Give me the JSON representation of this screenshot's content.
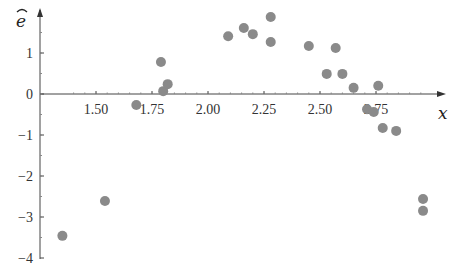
{
  "chart_data": {
    "type": "scatter",
    "title": "",
    "xlabel": "x",
    "ylabel": "ê (residuals)",
    "xlim": [
      1.33,
      3.05
    ],
    "ylim": [
      -4,
      2
    ],
    "x_ticks": [
      1.5,
      1.75,
      2.0,
      2.25,
      2.5,
      2.75
    ],
    "x_tick_labels": [
      "1.50",
      "1.75",
      "2.00",
      "2.25",
      "2.50",
      "2.75"
    ],
    "y_ticks": [
      -4,
      -3,
      -2,
      -1,
      0,
      1
    ],
    "y_tick_labels": [
      "−4",
      "−3",
      "−2",
      "−1",
      "0",
      "1"
    ],
    "grid": false,
    "legend": null,
    "marker_color": "#8a8a8a",
    "series": [
      {
        "name": "residuals",
        "points": [
          {
            "x": 1.35,
            "y": -3.46
          },
          {
            "x": 1.54,
            "y": -2.61
          },
          {
            "x": 1.68,
            "y": -0.27
          },
          {
            "x": 1.79,
            "y": 0.78
          },
          {
            "x": 1.8,
            "y": 0.07
          },
          {
            "x": 1.82,
            "y": 0.24
          },
          {
            "x": 2.09,
            "y": 1.41
          },
          {
            "x": 2.16,
            "y": 1.61
          },
          {
            "x": 2.2,
            "y": 1.46
          },
          {
            "x": 2.28,
            "y": 1.88
          },
          {
            "x": 2.28,
            "y": 1.27
          },
          {
            "x": 2.45,
            "y": 1.17
          },
          {
            "x": 2.53,
            "y": 0.49
          },
          {
            "x": 2.57,
            "y": 1.12
          },
          {
            "x": 2.6,
            "y": 0.49
          },
          {
            "x": 2.65,
            "y": 0.15
          },
          {
            "x": 2.71,
            "y": -0.37
          },
          {
            "x": 2.74,
            "y": -0.44
          },
          {
            "x": 2.76,
            "y": 0.2
          },
          {
            "x": 2.78,
            "y": -0.83
          },
          {
            "x": 2.84,
            "y": -0.9
          },
          {
            "x": 2.96,
            "y": -2.56
          },
          {
            "x": 2.96,
            "y": -2.85
          }
        ]
      }
    ]
  },
  "labels": {
    "x_axis_var": "x",
    "y_axis_var": "e",
    "y_axis_hat": "ˆ"
  }
}
